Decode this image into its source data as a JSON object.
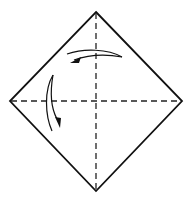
{
  "diagram": {
    "type": "origami-fold-diagram",
    "shape": "square-rotated-45-diamond",
    "colors": {
      "background": "#ffffff",
      "stroke": "#111111",
      "fold_line": "#222222"
    },
    "corners": {
      "top": [
        96,
        12
      ],
      "right": [
        182,
        101
      ],
      "bottom": [
        96,
        191
      ],
      "left": [
        10,
        101
      ]
    },
    "fold_lines": [
      {
        "name": "vertical-valley-fold",
        "style": "dashed",
        "from": [
          96,
          12
        ],
        "to": [
          96,
          191
        ]
      },
      {
        "name": "horizontal-valley-fold",
        "style": "dashed",
        "from": [
          10,
          101
        ],
        "to": [
          182,
          101
        ]
      }
    ],
    "arrows": [
      {
        "name": "fold-arrow-top-right-to-left",
        "direction": "right-to-left",
        "from": [
          122,
          57
        ],
        "to": [
          70,
          62
        ]
      },
      {
        "name": "fold-arrow-left-downward",
        "direction": "top-to-bottom",
        "from": [
          53,
          75
        ],
        "to": [
          59,
          128
        ]
      }
    ]
  }
}
